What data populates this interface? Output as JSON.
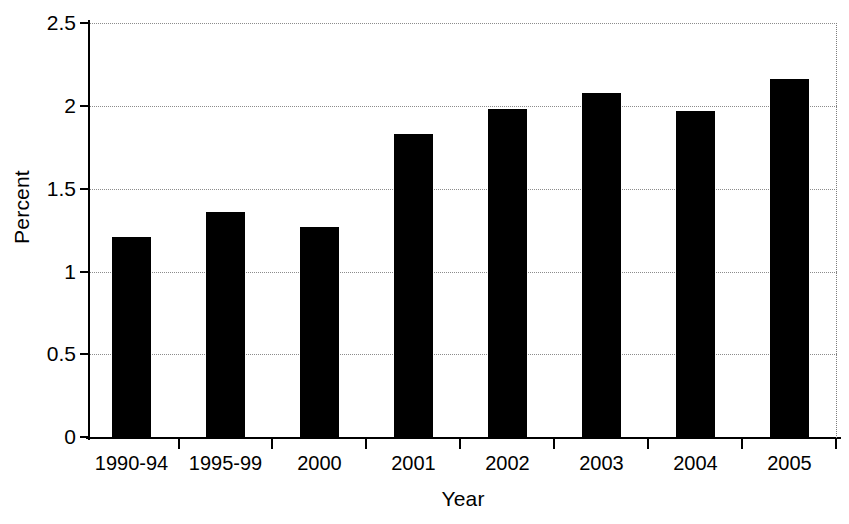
{
  "chart_data": {
    "type": "bar",
    "title": "",
    "xlabel": "Year",
    "ylabel": "Percent",
    "categories": [
      "1990-94",
      "1995-99",
      "2000",
      "2001",
      "2002",
      "2003",
      "2004",
      "2005"
    ],
    "values": [
      1.21,
      1.36,
      1.27,
      1.83,
      1.98,
      2.08,
      1.97,
      2.16
    ],
    "ylim": [
      0,
      2.5
    ],
    "yticks": [
      0,
      0.5,
      1,
      1.5,
      2,
      2.5
    ],
    "ytick_labels": [
      "0",
      "0.5",
      "1",
      "1.5",
      "2",
      "2.5"
    ],
    "grid": true,
    "grid_axis": "y",
    "grid_style": "dotted",
    "legend": null,
    "bar_color": "#000000",
    "background_color": "#ffffff",
    "axis_color": "#000000"
  },
  "axis": {
    "y_title": "Percent",
    "x_title": "Year"
  }
}
